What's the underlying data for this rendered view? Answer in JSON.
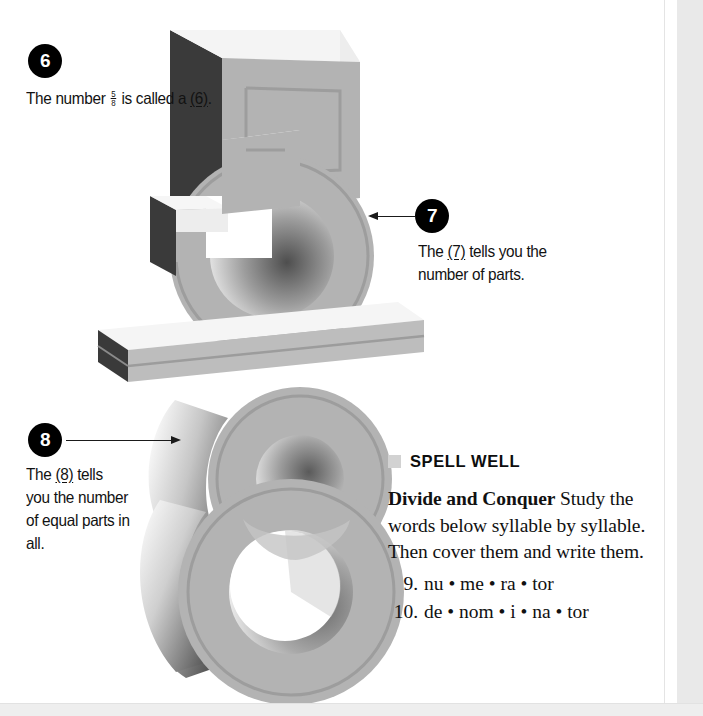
{
  "page": {
    "width": 703,
    "height": 716,
    "background": "#ffffff"
  },
  "callouts": [
    {
      "number": "6",
      "badge_label": "6",
      "text_before": "The number ",
      "fraction": {
        "numerator": "5",
        "denominator": "8"
      },
      "text_middle": " is called a ",
      "blank_label": "(6)",
      "text_after": ".",
      "full_text": "The number 5/8 is called a (6)."
    },
    {
      "number": "7",
      "badge_label": "7",
      "text_before": "The ",
      "blank_label": "(7)",
      "text_after": " tells you the number of parts.",
      "full_text": "The (7) tells you the number of parts."
    },
    {
      "number": "8",
      "badge_label": "8",
      "text_before": "The ",
      "blank_label": "(8)",
      "text_after": " tells you the number of equal parts in all.",
      "full_text": "The (8) tells you the number of equal parts in all."
    }
  ],
  "artwork": {
    "description": "three-dimensional extruded fraction five eighths",
    "numerator_digit": "5",
    "denominator_digit": "8",
    "fraction_bar": "slab",
    "colors": {
      "top_face": "#f4f4f4",
      "front_face": "#b3b3b3",
      "side_face": "#3c3c3c",
      "outline": "#9a9a9a",
      "shadow": "#8d8d8d"
    }
  },
  "spell_well": {
    "bullet": "square-bullet",
    "title": "SPELL WELL",
    "lead_in": "Divide and Conquer",
    "instructions": " Study the words below syllable by syllable. Then cover them and write them.",
    "items": [
      {
        "index": "9.",
        "word": "nu • me • ra • tor"
      },
      {
        "index": "10.",
        "word": "de • nom • i • na • tor"
      }
    ]
  }
}
